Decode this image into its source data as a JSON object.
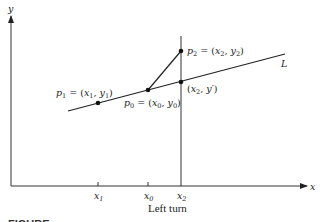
{
  "diagram": {
    "axes": {
      "x_label": "x",
      "y_label": "y"
    },
    "ticks": [
      {
        "label": "x",
        "sub": "1"
      },
      {
        "label": "x",
        "sub": "0"
      },
      {
        "label": "x",
        "sub": "2"
      }
    ],
    "points": {
      "p1": {
        "name": "p",
        "sub": "1",
        "eq": " = (",
        "x": "x",
        "xsub": "1",
        "sep": ", ",
        "y": "y",
        "ysub": "1",
        "close": ")"
      },
      "p0": {
        "name": "p",
        "sub": "0",
        "eq": " = (",
        "x": "x",
        "xsub": "0",
        "sep": ", ",
        "y": "y",
        "ysub": "0",
        "close": ")"
      },
      "p2": {
        "name": "p",
        "sub": "2",
        "eq": " = (",
        "x": "x",
        "xsub": "2",
        "sep": ", ",
        "y": "y",
        "ysub": "2",
        "close": ")"
      },
      "proj": {
        "open": "(",
        "x": "x",
        "xsub": "2",
        "sep": ", ",
        "y": "y′",
        "close": ")"
      }
    },
    "line_label": "L",
    "subtitle": "Left turn",
    "caption": "FIGURE"
  }
}
